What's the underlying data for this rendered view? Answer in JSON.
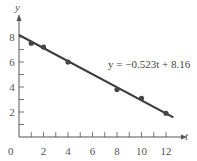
{
  "chart_data": {
    "type": "scatter",
    "title": "",
    "xlabel": "t",
    "ylabel": "y",
    "xlim": [
      0,
      13
    ],
    "ylim": [
      0,
      9
    ],
    "x_ticks": [
      2,
      4,
      6,
      8,
      10,
      12
    ],
    "y_ticks": [
      2,
      4,
      6,
      8
    ],
    "origin_label": "0",
    "grid": false,
    "points": [
      {
        "t": 1,
        "y": 7.5
      },
      {
        "t": 2,
        "y": 7.2
      },
      {
        "t": 4,
        "y": 6.0
      },
      {
        "t": 8,
        "y": 3.8
      },
      {
        "t": 10,
        "y": 3.1
      },
      {
        "t": 12,
        "y": 1.9
      }
    ],
    "fit_line": {
      "slope": -0.523,
      "intercept": 8.16,
      "t_range": [
        0,
        12.6
      ]
    },
    "annotation": "y = −0.523t + 8.16"
  },
  "colors": {
    "line": "#3a3a3a",
    "axis": "#555555",
    "point": "#444444"
  }
}
